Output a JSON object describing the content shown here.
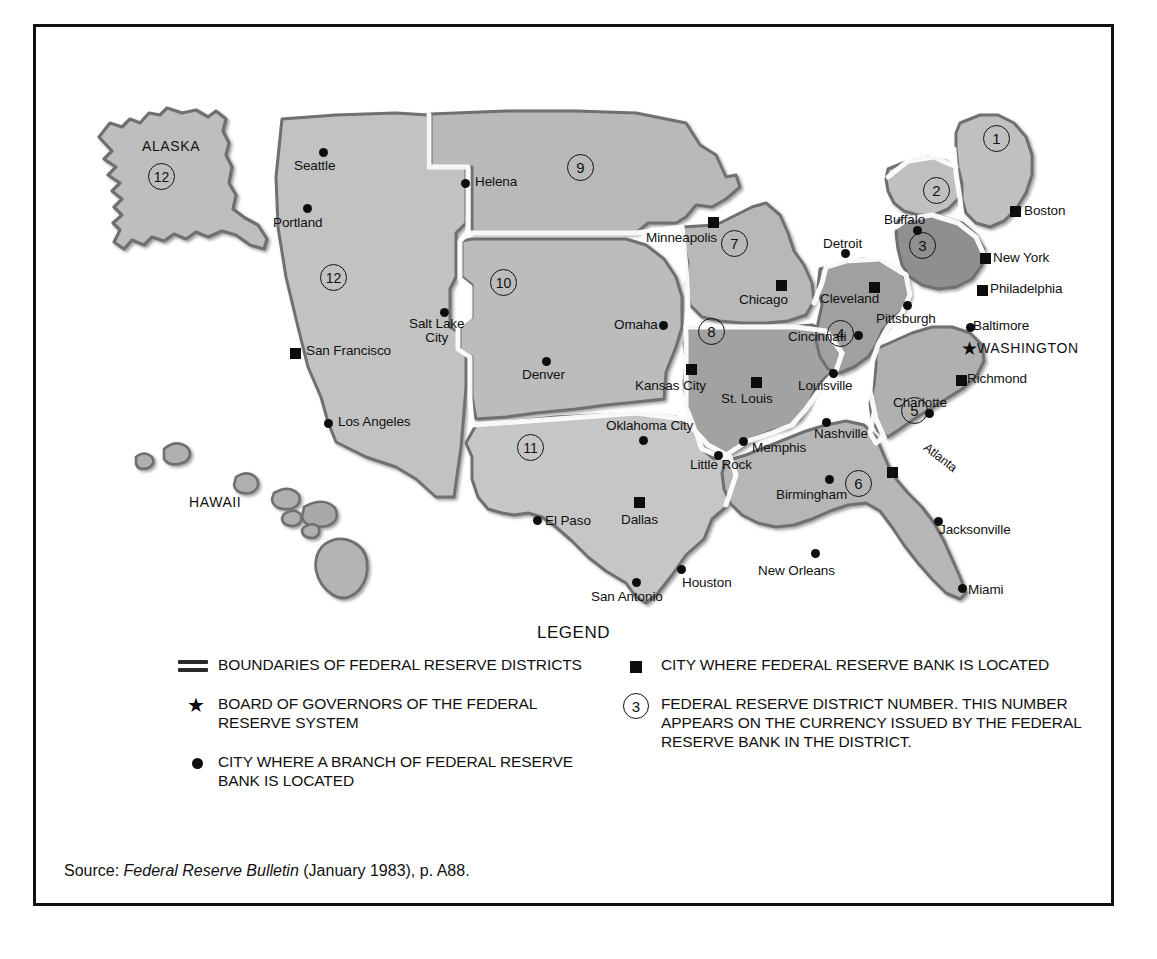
{
  "figure": {
    "legend_title": "LEGEND",
    "source_prefix": "Source:",
    "source_italic": "Federal Reserve Bulletin",
    "source_suffix": "(January 1983), p. A88."
  },
  "map": {
    "region_labels": [
      {
        "name": "ALASKA",
        "x": 106,
        "y": 112
      },
      {
        "name": "HAWAII",
        "x": 153,
        "y": 468
      }
    ],
    "districts": [
      {
        "number": "1",
        "x": 947,
        "y": 98
      },
      {
        "number": "2",
        "x": 887,
        "y": 150
      },
      {
        "number": "3",
        "x": 873,
        "y": 205
      },
      {
        "number": "4",
        "x": 791,
        "y": 293
      },
      {
        "number": "5",
        "x": 865,
        "y": 370
      },
      {
        "number": "6",
        "x": 809,
        "y": 443
      },
      {
        "number": "7",
        "x": 685,
        "y": 203
      },
      {
        "number": "8",
        "x": 662,
        "y": 291
      },
      {
        "number": "9",
        "x": 531,
        "y": 127
      },
      {
        "number": "10",
        "x": 454,
        "y": 242
      },
      {
        "number": "11",
        "x": 481,
        "y": 407
      },
      {
        "number": "12",
        "x": 284,
        "y": 237
      },
      {
        "number": "12alaska",
        "x": 112,
        "y": 136,
        "label": "12"
      }
    ],
    "branch_cities": [
      {
        "name": "Seattle",
        "mx": 283,
        "my": 121,
        "lx": 258,
        "ly": 132
      },
      {
        "name": "Portland",
        "mx": 267,
        "my": 177,
        "lx": 237,
        "ly": 189
      },
      {
        "name": "Salt Lake City",
        "mx": 404,
        "my": 281,
        "lx": 373,
        "ly": 290,
        "two": true
      },
      {
        "name": "Los Angeles",
        "mx": 288,
        "my": 392,
        "lx": 302,
        "ly": 388
      },
      {
        "name": "Helena",
        "mx": 425,
        "my": 152,
        "lx": 439,
        "ly": 148
      },
      {
        "name": "Omaha",
        "mx": 623,
        "my": 294,
        "lx": 578,
        "ly": 291
      },
      {
        "name": "Denver",
        "mx": 506,
        "my": 330,
        "lx": 486,
        "ly": 341
      },
      {
        "name": "Oklahoma City",
        "mx": 603,
        "my": 409,
        "lx": 570,
        "ly": 392
      },
      {
        "name": "El Paso",
        "mx": 497,
        "my": 489,
        "lx": 509,
        "ly": 487
      },
      {
        "name": "San Antonio",
        "mx": 596,
        "my": 551,
        "lx": 555,
        "ly": 563
      },
      {
        "name": "Houston",
        "mx": 641,
        "my": 538,
        "lx": 646,
        "ly": 549
      },
      {
        "name": "Little Rock",
        "mx": 678,
        "my": 424,
        "lx": 654,
        "ly": 431
      },
      {
        "name": "Memphis",
        "mx": 703,
        "my": 410,
        "lx": 716,
        "ly": 414
      },
      {
        "name": "Nashville",
        "mx": 786,
        "my": 391,
        "lx": 778,
        "ly": 400
      },
      {
        "name": "Louisville",
        "mx": 793,
        "my": 342,
        "lx": 762,
        "ly": 352
      },
      {
        "name": "Birmingham",
        "mx": 789,
        "my": 448,
        "lx": 740,
        "ly": 461
      },
      {
        "name": "New Orleans",
        "mx": 775,
        "my": 522,
        "lx": 722,
        "ly": 537
      },
      {
        "name": "Jacksonville",
        "mx": 898,
        "my": 490,
        "lx": 903,
        "ly": 496
      },
      {
        "name": "Miami",
        "mx": 922,
        "my": 557,
        "lx": 932,
        "ly": 556
      },
      {
        "name": "Charlotte",
        "mx": 889,
        "my": 382,
        "lx": 857,
        "ly": 369
      },
      {
        "name": "Cincinnati",
        "mx": 818,
        "my": 304,
        "lx": 752,
        "ly": 303
      },
      {
        "name": "Detroit",
        "mx": 805,
        "my": 222,
        "lx": 787,
        "ly": 210
      },
      {
        "name": "Buffalo",
        "mx": 877,
        "my": 199,
        "lx": 848,
        "ly": 186
      },
      {
        "name": "Pittsburgh",
        "mx": 867,
        "my": 274,
        "lx": 840,
        "ly": 285
      },
      {
        "name": "Baltimore",
        "mx": 930,
        "my": 296,
        "lx": 937,
        "ly": 292
      }
    ],
    "bank_cities": [
      {
        "name": "San Francisco",
        "mx": 254,
        "my": 321,
        "lx": 270,
        "ly": 317
      },
      {
        "name": "Minneapolis",
        "mx": 672,
        "my": 190,
        "lx": 610,
        "ly": 204
      },
      {
        "name": "Chicago",
        "mx": 740,
        "my": 253,
        "lx": 703,
        "ly": 266
      },
      {
        "name": "Kansas City",
        "mx": 650,
        "my": 337,
        "lx": 599,
        "ly": 352
      },
      {
        "name": "St. Louis",
        "mx": 715,
        "my": 350,
        "lx": 685,
        "ly": 365
      },
      {
        "name": "Dallas",
        "mx": 598,
        "my": 470,
        "lx": 585,
        "ly": 486
      },
      {
        "name": "Atlanta",
        "mx": 851,
        "my": 440,
        "lx": 893,
        "ly": 414,
        "rot": true
      },
      {
        "name": "Richmond",
        "mx": 920,
        "my": 348,
        "lx": 931,
        "ly": 345
      },
      {
        "name": "Cleveland",
        "mx": 833,
        "my": 255,
        "lx": 784,
        "ly": 265
      },
      {
        "name": "Philadelphia",
        "mx": 941,
        "my": 258,
        "lx": 954,
        "ly": 255
      },
      {
        "name": "New York",
        "mx": 944,
        "my": 226,
        "lx": 957,
        "ly": 224
      },
      {
        "name": "Boston",
        "mx": 974,
        "my": 179,
        "lx": 988,
        "ly": 177
      }
    ],
    "capital": {
      "name": "WASHINGTON",
      "mx": 925,
      "my": 312,
      "lx": 941,
      "ly": 312
    }
  },
  "legend": {
    "items_left": [
      {
        "symbol": "boundary-lines",
        "text": "BOUNDARIES OF FEDERAL RESERVE DISTRICTS"
      },
      {
        "symbol": "star",
        "text": "BOARD OF GOVERNORS OF THE FEDERAL RESERVE SYSTEM"
      },
      {
        "symbol": "dot",
        "text": "CITY WHERE A BRANCH OF FEDERAL RESERVE BANK IS LOCATED"
      }
    ],
    "items_right": [
      {
        "symbol": "square",
        "text": "CITY WHERE FEDERAL RESERVE BANK IS LOCATED"
      },
      {
        "symbol": "circled-number",
        "symbol_value": "3",
        "text": "FEDERAL RESERVE DISTRICT NUMBER. THIS NUMBER APPEARS ON THE CURRENCY ISSUED BY THE FEDERAL RESERVE BANK IN THE DISTRICT."
      }
    ]
  },
  "colors": {
    "land_light": "#c3c3c3",
    "land_mid": "#b4b4b4",
    "land_dark": "#9a9a9a",
    "outline": "#6f6f6f",
    "boundary_white": "#ffffff",
    "ink": "#111111",
    "frame": "#111111"
  }
}
